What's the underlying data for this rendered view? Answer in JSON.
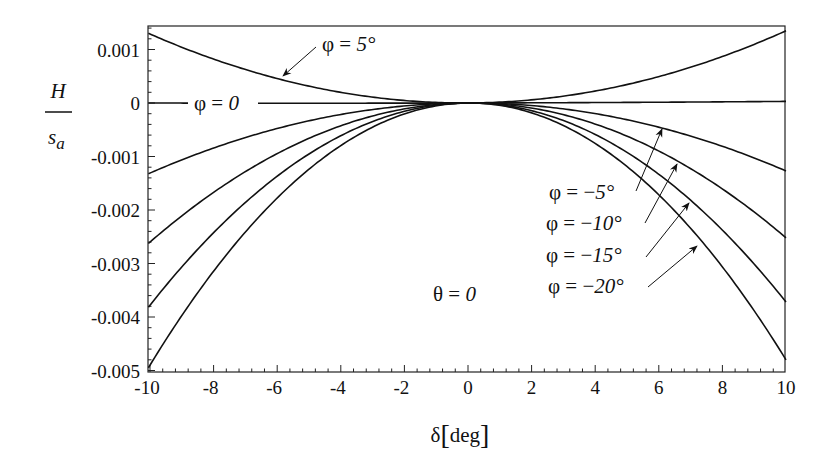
{
  "chart_data": {
    "type": "line",
    "title": "",
    "xlabel": "δ[deg]",
    "ylabel": {
      "numerator": "H",
      "denominator": "s",
      "subscript": "a"
    },
    "xlim": [
      -10.05,
      10
    ],
    "ylim": [
      -0.005,
      0.00143
    ],
    "grid": false,
    "legend": "inline annotations",
    "x_ticks": [
      -10,
      -8,
      -6,
      -4,
      -2,
      0,
      2,
      4,
      6,
      8,
      10
    ],
    "x_tick_labels": [
      "-10",
      "-8",
      "-6",
      "-4",
      "-2",
      "0",
      "2",
      "4",
      "6",
      "8",
      "10"
    ],
    "y_ticks": [
      0.001,
      0,
      -0.001,
      -0.002,
      -0.003,
      -0.004,
      -0.005
    ],
    "y_tick_labels": [
      "0.001",
      "0",
      "-0.001",
      "-0.002",
      "-0.003",
      "-0.004",
      "-0.005"
    ],
    "x": [
      -10,
      -8,
      -6,
      -4,
      -2,
      0,
      2,
      4,
      6,
      8,
      10
    ],
    "series": [
      {
        "name": "φ = 5°",
        "values": [
          0.00129,
          0.00083,
          0.00047,
          0.00021,
          5e-05,
          0,
          5e-05,
          0.00022,
          0.00049,
          0.00086,
          0.00135
        ]
      },
      {
        "name": "φ = 0",
        "values": [
          0,
          0,
          0,
          0,
          0,
          0,
          1e-05,
          1e-05,
          2e-05,
          2e-05,
          3e-05
        ]
      },
      {
        "name": "φ = −5°",
        "values": [
          -0.00131,
          -0.00084,
          -0.00047,
          -0.00021,
          -5e-05,
          0,
          -5e-05,
          -0.0002,
          -0.00046,
          -0.00081,
          -0.00127
        ]
      },
      {
        "name": "φ = −10°",
        "values": [
          -0.0026,
          -0.00166,
          -0.00094,
          -0.00042,
          -0.0001,
          0,
          -0.0001,
          -0.0004,
          -0.00091,
          -0.00161,
          -0.00252
        ]
      },
      {
        "name": "φ = −15°",
        "values": [
          -0.00378,
          -0.00242,
          -0.00136,
          -0.0006,
          -0.00015,
          0,
          -0.00015,
          -0.0006,
          -0.00134,
          -0.00238,
          -0.00372
        ]
      },
      {
        "name": "φ = −20°",
        "values": [
          -0.0049,
          -0.00314,
          -0.00176,
          -0.00078,
          -0.0002,
          0,
          -0.00019,
          -0.00077,
          -0.00173,
          -0.00307,
          -0.0048
        ]
      }
    ],
    "annotations": [
      "φ = 5°",
      "φ = 0",
      "φ = −5°",
      "φ = −10°",
      "φ = −15°",
      "φ = −20°",
      "θ = 0"
    ]
  },
  "labels": {
    "phi_5": {
      "pre": "φ = ",
      "val": "5°"
    },
    "phi_0": {
      "pre": "φ = ",
      "val": "0"
    },
    "phi_m5": {
      "pre": "φ = −",
      "val": "5°"
    },
    "phi_m10": {
      "pre": "φ = −",
      "val": "10°"
    },
    "phi_m15": {
      "pre": "φ = −",
      "val": "15°"
    },
    "phi_m20": {
      "pre": "φ = −",
      "val": "20°"
    },
    "theta": {
      "pre": "θ = ",
      "val": "0"
    },
    "xlabel_delta": "δ",
    "xlabel_unit": "deg",
    "ylabel_num": "H",
    "ylabel_den": "s",
    "ylabel_sub": "a"
  }
}
